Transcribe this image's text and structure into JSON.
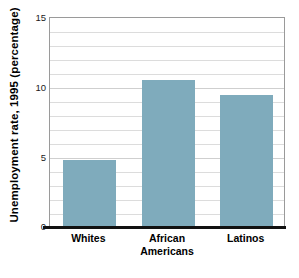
{
  "chart_data": {
    "type": "bar",
    "title": "",
    "xlabel": "",
    "ylabel": "Unemployment rate, 1995 (percentage)",
    "categories": [
      "Whites",
      "African Americans",
      "Latinos"
    ],
    "category_lines": [
      [
        "Whites"
      ],
      [
        "African",
        "Americans"
      ],
      [
        "Latinos"
      ]
    ],
    "values": [
      4.8,
      10.5,
      9.4
    ],
    "ylim": [
      0,
      15
    ],
    "yticks": [
      0,
      5,
      10,
      15
    ],
    "ytick_labels": [
      "0",
      "5",
      "10",
      "15"
    ],
    "minor_gridline_step": 1,
    "grid": "horizontal",
    "legend": "none",
    "bar_color": "#7FABBC",
    "gridline_color": "#dcdcdc",
    "frame_color": "#9a9a9a",
    "baseline_color": "#111111"
  },
  "axis": {
    "y_title": "Unemployment rate, 1995 (percentage)",
    "ticks": [
      {
        "label": "15",
        "value": 15
      },
      {
        "label": "10",
        "value": 10
      },
      {
        "label": "5",
        "value": 5
      },
      {
        "label": "0",
        "value": 0
      }
    ]
  },
  "bars": [
    {
      "label": "Whites",
      "line1": "Whites",
      "line2": "",
      "value": 4.8
    },
    {
      "label": "African Americans",
      "line1": "African",
      "line2": "Americans",
      "value": 10.5
    },
    {
      "label": "Latinos",
      "line1": "Latinos",
      "line2": "",
      "value": 9.4
    }
  ]
}
